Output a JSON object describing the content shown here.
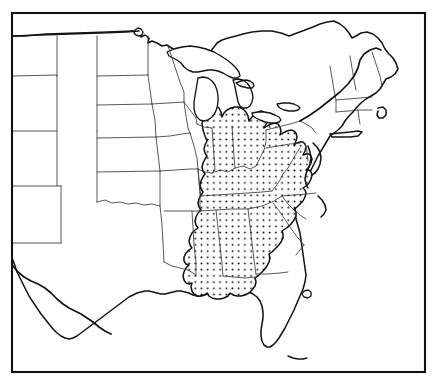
{
  "figure": {
    "kind": "distribution-map",
    "title": "",
    "caption": "",
    "region": "Eastern and Central United States",
    "background_color": "#ffffff",
    "line_color": "#151515",
    "border_color": "#111111",
    "state_line_color": "#3a3a3a"
  },
  "frame": {
    "x": 12,
    "y": 13,
    "width": 413,
    "height": 359,
    "stroke_width": 2.1
  },
  "legend": {
    "present": false,
    "entries": [
      {
        "symbol": "stipple",
        "label": "",
        "description": "Stippled (dotted) shading indicates the species range"
      }
    ]
  },
  "stipple": {
    "dot_color": "#000000",
    "dot_radius": 0.95,
    "spacing_x": 6.2,
    "spacing_y": 6.2,
    "fill_color": "#ffffff"
  },
  "chart_data": {
    "type": "map",
    "title": "",
    "xlabel": "",
    "ylabel": "",
    "projection": "unspecified",
    "shaded_regions_label": "Range (stippled)",
    "states_shaded": [
      "Illinois",
      "Indiana",
      "Ohio",
      "Kentucky",
      "Tennessee",
      "West Virginia",
      "Pennsylvania",
      "Maryland",
      "Virginia",
      "North Carolina",
      "South Carolina",
      "Georgia",
      "Alabama",
      "Mississippi",
      "Michigan",
      "Wisconsin",
      "Missouri",
      "Arkansas",
      "New York"
    ],
    "states_partially_shaded": [
      "Michigan",
      "Wisconsin",
      "Missouri",
      "Arkansas",
      "New York",
      "Virginia",
      "North Carolina",
      "South Carolina",
      "Georgia",
      "Pennsylvania"
    ],
    "states_unshaded": [
      "Maine",
      "New Hampshire",
      "Vermont",
      "Massachusetts",
      "Rhode Island",
      "Connecticut",
      "New Jersey",
      "Delaware",
      "Florida",
      "Louisiana",
      "Texas",
      "Oklahoma",
      "Kansas",
      "Nebraska",
      "South Dakota",
      "North Dakota",
      "Minnesota",
      "Iowa",
      "Colorado",
      "Wyoming",
      "Montana",
      "New Mexico"
    ],
    "features_drawn": [
      "Great Lakes",
      "Lake of the Woods",
      "Lake Okeechobee",
      "Chesapeake Bay",
      "Long Island",
      "Cape Cod",
      "Florida Keys",
      "Rio Grande",
      "Gulf of Mexico coastline",
      "Atlantic coastline",
      "US-Canada border"
    ]
  }
}
